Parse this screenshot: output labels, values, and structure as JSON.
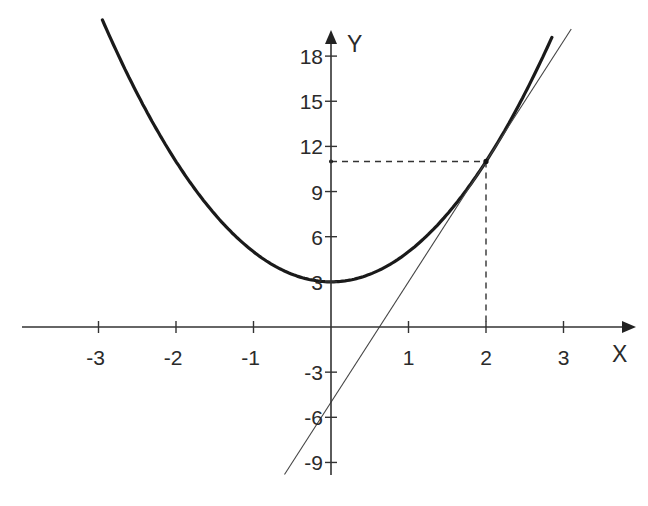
{
  "chart_data": {
    "type": "line",
    "title": "",
    "xlabel": "X",
    "ylabel": "Y",
    "xlim": [
      -4.0,
      3.9
    ],
    "ylim": [
      -10,
      20
    ],
    "grid": false,
    "legend": null,
    "x_ticks": [
      -3,
      -2,
      -1,
      1,
      2,
      3
    ],
    "x_tick_labels": [
      "-3",
      "-2",
      "-1",
      "1",
      "2",
      "3"
    ],
    "y_ticks": [
      18,
      15,
      12,
      9,
      6,
      3,
      -3,
      -6,
      -9
    ],
    "y_tick_labels": [
      "18",
      "15",
      "12",
      "9",
      "6",
      "3",
      "-3",
      "-6",
      "-9"
    ],
    "series": [
      {
        "name": "parabola",
        "style": "thick solid",
        "formula": "y = 2x^2 + 3",
        "x": [
          -2.95,
          -2.5,
          -2,
          -1.5,
          -1,
          -0.5,
          0,
          0.5,
          1,
          1.5,
          2,
          2.5,
          2.85
        ],
        "y": [
          20.4,
          15.5,
          11,
          7.5,
          5,
          3.5,
          3,
          3.5,
          5,
          7.5,
          11,
          15.5,
          19.2
        ]
      },
      {
        "name": "tangent-line",
        "style": "thin solid",
        "formula": "y = 8x - 5",
        "x": [
          -0.6,
          3.1
        ],
        "y": [
          -9.8,
          19.8
        ]
      }
    ],
    "annotations": [
      {
        "type": "point",
        "x": 2,
        "y": 11,
        "label": "tangent point"
      },
      {
        "type": "dashed-guide",
        "from": [
          0,
          11
        ],
        "to": [
          2,
          11
        ]
      },
      {
        "type": "dashed-guide",
        "from": [
          2,
          11
        ],
        "to": [
          2,
          0
        ]
      }
    ]
  },
  "axes": {
    "x_title": "X",
    "y_title": "Y"
  }
}
